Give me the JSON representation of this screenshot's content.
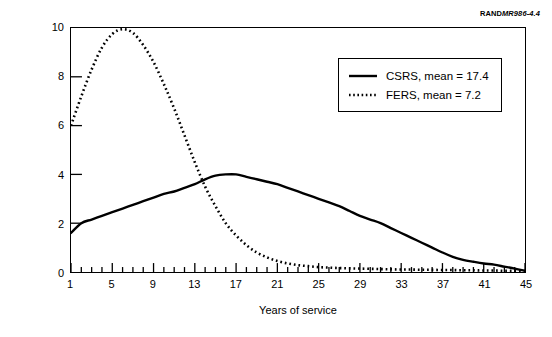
{
  "source_tag": {
    "prefix": "RAND",
    "reference": "MR986-4.4"
  },
  "axes": {
    "y_title": "Fraction",
    "x_title": "Years of service",
    "y_ticks": [
      0,
      2,
      4,
      6,
      8,
      10
    ],
    "x_ticks": [
      1,
      5,
      9,
      13,
      17,
      21,
      25,
      29,
      33,
      37,
      41,
      45
    ],
    "xlim": [
      1,
      45
    ],
    "ylim": [
      0,
      10
    ]
  },
  "legend": {
    "items": [
      {
        "label": "CSRS, mean = 17.4",
        "style": "solid",
        "color": "#000000"
      },
      {
        "label": "FERS, mean = 7.2",
        "style": "dotted",
        "color": "#000000"
      }
    ]
  },
  "chart_data": {
    "type": "line",
    "title": "",
    "xlabel": "Years of service",
    "ylabel": "Fraction",
    "xlim": [
      1,
      45
    ],
    "ylim": [
      0,
      10
    ],
    "grid": false,
    "legend_position": "top-right",
    "x": [
      1,
      2,
      3,
      4,
      5,
      6,
      7,
      8,
      9,
      10,
      11,
      12,
      13,
      14,
      15,
      16,
      17,
      18,
      19,
      20,
      21,
      22,
      23,
      24,
      25,
      26,
      27,
      28,
      29,
      30,
      31,
      32,
      33,
      34,
      35,
      36,
      37,
      38,
      39,
      40,
      41,
      42,
      43,
      44,
      45
    ],
    "series": [
      {
        "name": "CSRS, mean = 17.4",
        "style": "solid",
        "color": "#000000",
        "mean": 17.4,
        "values": [
          1.6,
          2.0,
          2.15,
          2.3,
          2.45,
          2.6,
          2.75,
          2.9,
          3.05,
          3.2,
          3.3,
          3.45,
          3.6,
          3.8,
          3.95,
          4.0,
          4.0,
          3.9,
          3.8,
          3.7,
          3.6,
          3.45,
          3.3,
          3.15,
          3.0,
          2.85,
          2.7,
          2.5,
          2.3,
          2.15,
          2.0,
          1.8,
          1.6,
          1.4,
          1.2,
          1.0,
          0.8,
          0.62,
          0.5,
          0.42,
          0.35,
          0.3,
          0.22,
          0.14,
          0.05
        ]
      },
      {
        "name": "FERS, mean = 7.2",
        "style": "dotted",
        "color": "#000000",
        "mean": 7.2,
        "values": [
          6.0,
          7.2,
          8.3,
          9.2,
          9.75,
          9.95,
          9.8,
          9.3,
          8.6,
          7.7,
          6.7,
          5.6,
          4.5,
          3.5,
          2.7,
          2.0,
          1.5,
          1.1,
          0.8,
          0.6,
          0.45,
          0.35,
          0.28,
          0.24,
          0.2,
          0.18,
          0.16,
          0.15,
          0.14,
          0.13,
          0.12,
          0.11,
          0.1,
          0.1,
          0.09,
          0.09,
          0.08,
          0.08,
          0.07,
          0.07,
          0.06,
          0.06,
          0.05,
          0.05,
          0.04
        ]
      }
    ]
  }
}
